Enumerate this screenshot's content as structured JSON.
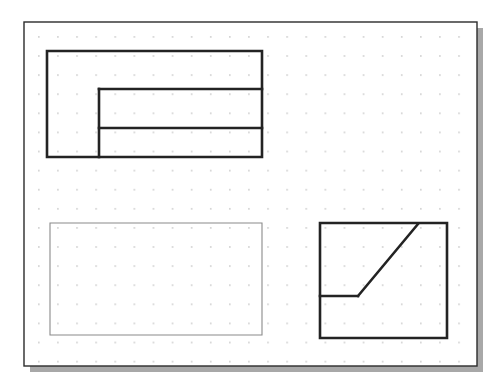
{
  "document": {
    "title": "Orthographic Projection Exercise",
    "sheet_type": "dotted-grid-paper",
    "width": 504,
    "height": 386
  },
  "colors": {
    "background": "#ffffff",
    "paper_fill": "#ffffff",
    "paper_border": "#2b2b2b",
    "paper_shadow": "#a8a8a8",
    "grid_dot": "#c8c8c8",
    "thick_line": "#232323",
    "thin_line": "#8a8a8a"
  },
  "paper": {
    "x": 24,
    "y": 22,
    "width": 453,
    "height": 344,
    "border_width": 1.4,
    "shadow_offset_x": 6,
    "shadow_offset_y": 6
  },
  "grid": {
    "visible": true,
    "spacing": 19.1,
    "origin_x": 38,
    "origin_y": 36,
    "dot_radius": 0.85,
    "columns": 23,
    "rows": 17
  },
  "figures": [
    {
      "name": "top-left-view",
      "label": "Top left stepped profile view",
      "line_weight": "thick",
      "stroke_width": 2.6,
      "outline": [
        [
          47,
          51
        ],
        [
          262,
          51
        ],
        [
          262,
          157
        ],
        [
          47,
          157
        ]
      ],
      "closed": true,
      "internal_lines": [
        {
          "name": "inner-vertical",
          "x1": 99,
          "y1": 89,
          "x2": 99,
          "y2": 157
        },
        {
          "name": "upper-horizontal",
          "x1": 99,
          "y1": 89,
          "x2": 262,
          "y2": 89
        },
        {
          "name": "lower-horizontal",
          "x1": 99,
          "y1": 128,
          "x2": 262,
          "y2": 128
        }
      ]
    },
    {
      "name": "bottom-left-view",
      "label": "Bottom left blank rectangle view",
      "line_weight": "thin",
      "stroke_width": 1.1,
      "outline": [
        [
          50,
          223
        ],
        [
          262,
          223
        ],
        [
          262,
          335
        ],
        [
          50,
          335
        ]
      ],
      "closed": true,
      "internal_lines": []
    },
    {
      "name": "bottom-right-view",
      "label": "Bottom right view with inclined surface",
      "line_weight": "thick",
      "stroke_width": 2.6,
      "outline": [
        [
          320,
          223
        ],
        [
          447,
          223
        ],
        [
          447,
          338
        ],
        [
          320,
          338
        ]
      ],
      "closed": true,
      "internal_lines": [
        {
          "name": "step-horizontal",
          "x1": 320,
          "y1": 296,
          "x2": 358,
          "y2": 296
        },
        {
          "name": "inclined-diagonal",
          "x1": 358,
          "y1": 296,
          "x2": 418,
          "y2": 224
        }
      ]
    }
  ]
}
